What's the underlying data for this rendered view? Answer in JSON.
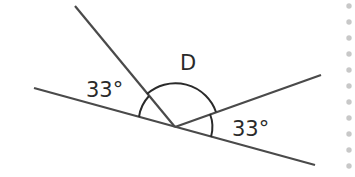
{
  "diagram": {
    "type": "angles-on-a-line",
    "labels": {
      "angle_left": "33°",
      "angle_right": "33°",
      "angle_unknown": "D"
    },
    "colors": {
      "line": "#4a4a4a",
      "text": "#2a2a2a",
      "dots": "#c8c8c8"
    },
    "dot_count": 11
  }
}
